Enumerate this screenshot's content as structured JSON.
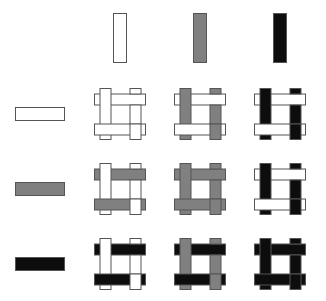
{
  "figure": {
    "title": "",
    "type": "weave-pattern-matrix",
    "background_color": "#ffffff",
    "rows": 4,
    "columns": 4
  },
  "palette": {
    "white": "#ffffff",
    "gray": "#808080",
    "black": "#0d0d0d",
    "stroke": "#555555",
    "background": "#ffffff"
  },
  "legend": {
    "column_header_label": "vertical strand color",
    "row_header_label": "horizontal strand color",
    "column_colors": [
      "white",
      "gray",
      "black"
    ],
    "row_colors": [
      "white",
      "gray",
      "black"
    ]
  },
  "chart_data": {
    "type": "heatmap",
    "title": "",
    "xlabel": "",
    "ylabel": "",
    "categories_x": [
      "white",
      "gray",
      "black"
    ],
    "categories_y": [
      "white",
      "gray",
      "black"
    ],
    "cells": [
      {
        "row": 0,
        "col": 0,
        "vertical": "white",
        "horizontal": "white"
      },
      {
        "row": 0,
        "col": 1,
        "vertical": "gray",
        "horizontal": "white"
      },
      {
        "row": 0,
        "col": 2,
        "vertical": "black",
        "horizontal": "white"
      },
      {
        "row": 1,
        "col": 0,
        "vertical": "white",
        "horizontal": "gray"
      },
      {
        "row": 1,
        "col": 1,
        "vertical": "gray",
        "horizontal": "gray"
      },
      {
        "row": 1,
        "col": 2,
        "vertical": "black",
        "horizontal": "white"
      },
      {
        "row": 2,
        "col": 0,
        "vertical": "white",
        "horizontal": "black"
      },
      {
        "row": 2,
        "col": 1,
        "vertical": "gray",
        "horizontal": "black"
      },
      {
        "row": 2,
        "col": 2,
        "vertical": "black",
        "horizontal": "black"
      }
    ]
  },
  "header_row": {
    "items": [
      {
        "name": "vertical-bar-white",
        "color": "white"
      },
      {
        "name": "vertical-bar-gray",
        "color": "gray"
      },
      {
        "name": "vertical-bar-black",
        "color": "black"
      }
    ]
  },
  "header_column": {
    "items": [
      {
        "name": "horizontal-bar-white",
        "color": "white"
      },
      {
        "name": "horizontal-bar-gray",
        "color": "gray"
      },
      {
        "name": "horizontal-bar-black",
        "color": "black"
      }
    ]
  }
}
